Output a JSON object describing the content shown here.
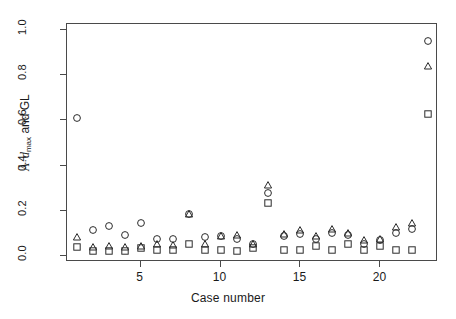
{
  "chart_data": {
    "type": "scatter",
    "title": "",
    "xlabel": "Case number",
    "ylabel_parts": {
      "angstrom": "Å",
      "dot": "·",
      "d": "d",
      "sub": "max",
      "tail": "and GL"
    },
    "ylabel": "Å · d max and GL",
    "xlim": [
      0.4,
      23.6
    ],
    "ylim": [
      -0.025,
      1.025
    ],
    "xticks": [
      5,
      10,
      15,
      20
    ],
    "yticks": [
      0.0,
      0.2,
      0.4,
      0.6,
      0.8,
      1.0
    ],
    "ytick_labels": [
      "0.0",
      "0.2",
      "0.4",
      "0.6",
      "0.8",
      "1.0"
    ],
    "xtick_labels": [
      "5",
      "10",
      "15",
      "20"
    ],
    "grid": false,
    "legend": "none",
    "x": [
      1,
      2,
      3,
      4,
      5,
      6,
      7,
      8,
      9,
      10,
      11,
      12,
      13,
      14,
      15,
      16,
      17,
      18,
      19,
      20,
      21,
      22,
      23
    ],
    "series": [
      {
        "name": "circle",
        "marker": "circle",
        "values": [
          0.61,
          0.115,
          0.135,
          0.095,
          0.145,
          0.075,
          0.075,
          0.185,
          0.085,
          0.09,
          0.075,
          0.055,
          0.28,
          0.09,
          0.1,
          0.075,
          0.105,
          0.095,
          0.055,
          0.07,
          0.105,
          0.12,
          0.95
        ]
      },
      {
        "name": "triangle",
        "marker": "triangle",
        "values": [
          0.085,
          0.04,
          0.045,
          0.04,
          0.045,
          0.055,
          0.05,
          0.185,
          0.055,
          0.09,
          0.095,
          0.055,
          0.315,
          0.1,
          0.115,
          0.09,
          0.12,
          0.105,
          0.07,
          0.075,
          0.13,
          0.145,
          0.84
        ]
      },
      {
        "name": "square",
        "marker": "square",
        "values": [
          0.04,
          0.025,
          0.025,
          0.025,
          0.035,
          0.03,
          0.03,
          0.055,
          0.03,
          0.03,
          0.025,
          0.035,
          0.235,
          0.03,
          0.03,
          0.045,
          0.03,
          0.055,
          0.03,
          0.045,
          0.03,
          0.03,
          0.63
        ]
      }
    ]
  }
}
